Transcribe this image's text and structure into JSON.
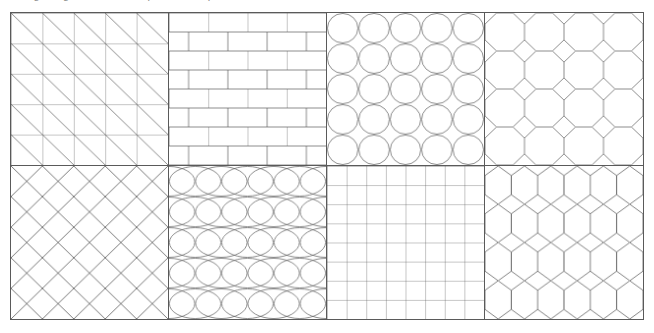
{
  "caption": {
    "text": "Figure: geometric hatch pattern samples",
    "clipped": true
  },
  "board": {
    "label": "pattern-swatch-board",
    "columns": 4,
    "rows": 2,
    "stroke_color": "#5a5a5a",
    "fill_color": "#ffffff",
    "stroke_width": 1
  },
  "swatches": [
    {
      "index": 1,
      "name": "diagonal-triangle-grid",
      "type": "square-grid-with-diagonals",
      "cols": 5,
      "rows": 5,
      "diagonal_direction": "top-left-to-bottom-right"
    },
    {
      "index": 2,
      "name": "running-bond-brick",
      "type": "brick",
      "cols": 4,
      "rows": 8,
      "offset": "half-brick-alternating"
    },
    {
      "index": 3,
      "name": "tangent-circle-grid",
      "type": "circles",
      "cols": 5,
      "rows": 5,
      "packing": "square-tangent"
    },
    {
      "index": 4,
      "name": "octagon-square-tessellation",
      "type": "truncated-square-tiling",
      "cols": 4,
      "rows": 4
    },
    {
      "index": 5,
      "name": "diamond-lattice-crosshatch",
      "type": "diagonal-crosshatch",
      "cols": 5,
      "rows": 5,
      "angle_degrees": 45
    },
    {
      "index": 6,
      "name": "ellipse-grid",
      "type": "ellipses",
      "cols": 3,
      "rows": 5,
      "aspect": "wide"
    },
    {
      "index": 7,
      "name": "square-mesh-grid",
      "type": "plain-grid",
      "cols": 8,
      "rows": 8
    },
    {
      "index": 8,
      "name": "hexagonal-honeycomb",
      "type": "hexagons",
      "cols": 3,
      "rows": 4,
      "orientation": "pointy-top"
    }
  ]
}
